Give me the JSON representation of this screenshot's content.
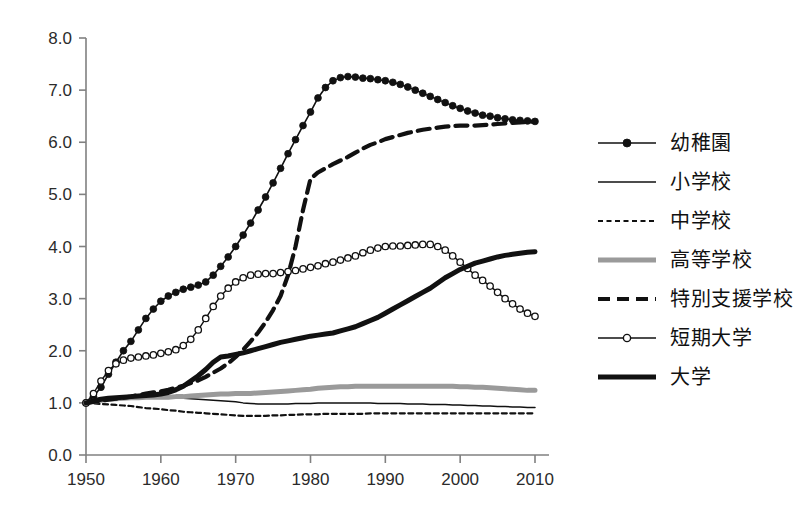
{
  "chart_data": {
    "type": "line",
    "title": "",
    "xlabel": "",
    "ylabel": "",
    "xlim": [
      1950,
      2010
    ],
    "ylim": [
      0.0,
      8.0
    ],
    "grid": false,
    "legend_position": "right",
    "x_tick_labels": [
      "1950",
      "1960",
      "1970",
      "1980",
      "1990",
      "2000",
      "2010"
    ],
    "x_ticks": [
      1950,
      1960,
      1970,
      1980,
      1990,
      2000,
      2010
    ],
    "y_tick_labels": [
      "0.0",
      "1.0",
      "2.0",
      "3.0",
      "4.0",
      "5.0",
      "6.0",
      "7.0",
      "8.0"
    ],
    "y_ticks": [
      0.0,
      1.0,
      2.0,
      3.0,
      4.0,
      5.0,
      6.0,
      7.0,
      8.0
    ],
    "x": [
      1950,
      1951,
      1952,
      1953,
      1954,
      1955,
      1956,
      1957,
      1958,
      1959,
      1960,
      1961,
      1962,
      1963,
      1964,
      1965,
      1966,
      1967,
      1968,
      1969,
      1970,
      1971,
      1972,
      1973,
      1974,
      1975,
      1976,
      1977,
      1978,
      1979,
      1980,
      1981,
      1982,
      1983,
      1984,
      1985,
      1986,
      1987,
      1988,
      1989,
      1990,
      1991,
      1992,
      1993,
      1994,
      1995,
      1996,
      1997,
      1998,
      1999,
      2000,
      2001,
      2002,
      2003,
      2004,
      2005,
      2006,
      2007,
      2008,
      2009,
      2010
    ],
    "series": [
      {
        "name": "幼稚園",
        "style": "thin-line-filled-marker",
        "color": "#111111",
        "values": [
          1.0,
          1.12,
          1.3,
          1.55,
          1.78,
          2.0,
          2.18,
          2.4,
          2.62,
          2.8,
          2.95,
          3.05,
          3.12,
          3.18,
          3.22,
          3.26,
          3.32,
          3.45,
          3.62,
          3.8,
          4.0,
          4.22,
          4.45,
          4.7,
          4.95,
          5.22,
          5.5,
          5.78,
          6.05,
          6.32,
          6.58,
          6.85,
          7.05,
          7.18,
          7.24,
          7.26,
          7.25,
          7.23,
          7.22,
          7.2,
          7.18,
          7.15,
          7.11,
          7.06,
          7.0,
          6.94,
          6.88,
          6.82,
          6.76,
          6.7,
          6.65,
          6.6,
          6.56,
          6.52,
          6.5,
          6.47,
          6.45,
          6.43,
          6.42,
          6.41,
          6.4
        ]
      },
      {
        "name": "小学校",
        "style": "thin-line",
        "color": "#111111",
        "values": [
          1.0,
          1.04,
          1.07,
          1.09,
          1.1,
          1.11,
          1.12,
          1.12,
          1.12,
          1.12,
          1.12,
          1.11,
          1.1,
          1.09,
          1.08,
          1.07,
          1.06,
          1.05,
          1.04,
          1.03,
          1.02,
          1.0,
          0.99,
          0.98,
          0.98,
          0.98,
          0.98,
          0.98,
          0.99,
          0.99,
          0.99,
          1.0,
          1.0,
          1.0,
          1.0,
          1.0,
          1.0,
          1.0,
          1.0,
          0.99,
          0.99,
          0.99,
          0.99,
          0.98,
          0.98,
          0.98,
          0.97,
          0.97,
          0.97,
          0.96,
          0.96,
          0.95,
          0.95,
          0.94,
          0.94,
          0.93,
          0.93,
          0.92,
          0.92,
          0.91,
          0.91
        ]
      },
      {
        "name": "中学校",
        "style": "fine-dotted",
        "color": "#111111",
        "values": [
          1.0,
          0.99,
          0.98,
          0.97,
          0.96,
          0.95,
          0.94,
          0.92,
          0.9,
          0.89,
          0.88,
          0.86,
          0.85,
          0.83,
          0.82,
          0.81,
          0.8,
          0.79,
          0.78,
          0.77,
          0.76,
          0.75,
          0.75,
          0.75,
          0.75,
          0.76,
          0.76,
          0.77,
          0.77,
          0.78,
          0.78,
          0.78,
          0.79,
          0.79,
          0.79,
          0.79,
          0.79,
          0.79,
          0.8,
          0.8,
          0.8,
          0.8,
          0.8,
          0.8,
          0.8,
          0.8,
          0.8,
          0.8,
          0.8,
          0.8,
          0.8,
          0.8,
          0.8,
          0.8,
          0.8,
          0.8,
          0.8,
          0.8,
          0.8,
          0.8,
          0.8
        ]
      },
      {
        "name": "高等学校",
        "style": "thick-gray",
        "color": "#9a9a9a",
        "values": [
          1.0,
          1.03,
          1.05,
          1.07,
          1.08,
          1.09,
          1.1,
          1.1,
          1.11,
          1.11,
          1.11,
          1.11,
          1.12,
          1.12,
          1.13,
          1.14,
          1.15,
          1.16,
          1.17,
          1.17,
          1.18,
          1.18,
          1.18,
          1.19,
          1.2,
          1.21,
          1.22,
          1.23,
          1.24,
          1.25,
          1.26,
          1.28,
          1.29,
          1.3,
          1.31,
          1.31,
          1.32,
          1.32,
          1.32,
          1.32,
          1.32,
          1.32,
          1.32,
          1.32,
          1.32,
          1.32,
          1.32,
          1.32,
          1.32,
          1.32,
          1.31,
          1.31,
          1.3,
          1.3,
          1.29,
          1.28,
          1.27,
          1.26,
          1.25,
          1.24,
          1.24
        ]
      },
      {
        "name": "特別支援学校",
        "style": "thick-dashed",
        "color": "#111111",
        "values": [
          1.0,
          1.02,
          1.04,
          1.06,
          1.08,
          1.1,
          1.12,
          1.15,
          1.18,
          1.2,
          1.22,
          1.25,
          1.29,
          1.33,
          1.38,
          1.43,
          1.5,
          1.58,
          1.66,
          1.76,
          1.88,
          2.02,
          2.18,
          2.35,
          2.55,
          2.78,
          3.05,
          3.45,
          4.0,
          4.7,
          5.3,
          5.42,
          5.5,
          5.58,
          5.65,
          5.72,
          5.8,
          5.88,
          5.95,
          6.0,
          6.06,
          6.1,
          6.14,
          6.18,
          6.21,
          6.24,
          6.26,
          6.28,
          6.3,
          6.31,
          6.32,
          6.32,
          6.32,
          6.33,
          6.34,
          6.35,
          6.36,
          6.37,
          6.38,
          6.39,
          6.4
        ]
      },
      {
        "name": "短期大学",
        "style": "thin-line-open-marker",
        "color": "#111111",
        "values": [
          1.0,
          1.18,
          1.42,
          1.62,
          1.75,
          1.82,
          1.86,
          1.88,
          1.9,
          1.92,
          1.95,
          1.98,
          2.02,
          2.1,
          2.22,
          2.4,
          2.62,
          2.85,
          3.05,
          3.2,
          3.32,
          3.4,
          3.45,
          3.47,
          3.48,
          3.48,
          3.5,
          3.52,
          3.54,
          3.57,
          3.6,
          3.63,
          3.67,
          3.7,
          3.74,
          3.78,
          3.82,
          3.88,
          3.93,
          3.97,
          4.0,
          4.01,
          4.01,
          4.02,
          4.03,
          4.04,
          4.04,
          4.0,
          3.93,
          3.82,
          3.7,
          3.58,
          3.45,
          3.35,
          3.24,
          3.12,
          3.0,
          2.9,
          2.8,
          2.72,
          2.66
        ]
      },
      {
        "name": "大学",
        "style": "thick-black",
        "color": "#111111",
        "values": [
          1.0,
          1.04,
          1.07,
          1.09,
          1.1,
          1.11,
          1.12,
          1.13,
          1.14,
          1.15,
          1.17,
          1.2,
          1.25,
          1.32,
          1.42,
          1.52,
          1.64,
          1.78,
          1.88,
          1.9,
          1.93,
          1.96,
          2.0,
          2.04,
          2.08,
          2.12,
          2.16,
          2.19,
          2.22,
          2.25,
          2.28,
          2.3,
          2.32,
          2.34,
          2.38,
          2.42,
          2.46,
          2.52,
          2.58,
          2.64,
          2.72,
          2.8,
          2.88,
          2.96,
          3.04,
          3.12,
          3.2,
          3.3,
          3.4,
          3.48,
          3.56,
          3.62,
          3.68,
          3.72,
          3.76,
          3.8,
          3.83,
          3.85,
          3.87,
          3.89,
          3.9
        ]
      }
    ]
  },
  "legend": {
    "items": [
      {
        "label": "幼稚園",
        "style": "thin-line-filled-marker"
      },
      {
        "label": "小学校",
        "style": "thin-line"
      },
      {
        "label": "中学校",
        "style": "fine-dotted"
      },
      {
        "label": "高等学校",
        "style": "thick-gray"
      },
      {
        "label": "特別支援学校",
        "style": "thick-dashed"
      },
      {
        "label": "短期大学",
        "style": "thin-line-open-marker"
      },
      {
        "label": "大学",
        "style": "thick-black"
      }
    ]
  },
  "colors": {
    "axis": "#808080",
    "ink": "#111111",
    "gray_series": "#9a9a9a",
    "background": "#ffffff"
  }
}
